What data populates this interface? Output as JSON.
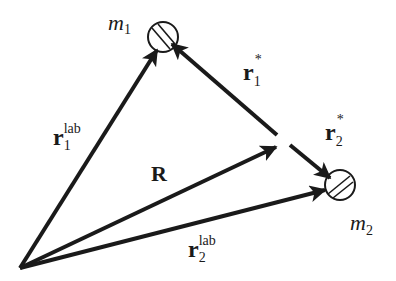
{
  "diagram": {
    "colors": {
      "stroke": "#1a1a1a",
      "background": "#ffffff"
    },
    "masses": [
      {
        "id": "m1",
        "label_base": "m",
        "label_sub": "1",
        "center": [
          163,
          37
        ],
        "radius": 15
      },
      {
        "id": "m2",
        "label_base": "m",
        "label_sub": "2",
        "center": [
          340,
          185
        ],
        "radius": 15
      }
    ],
    "origin": [
      20,
      268
    ],
    "cm_point": [
      282,
      145
    ],
    "vectors": [
      {
        "id": "r1-lab",
        "base": "r",
        "sub": "1",
        "sup": "lab",
        "from": "origin",
        "to": "m1"
      },
      {
        "id": "R",
        "base": "R",
        "sub": "",
        "sup": "",
        "from": "origin",
        "to": "cm"
      },
      {
        "id": "r2-lab",
        "base": "r",
        "sub": "2",
        "sup": "lab",
        "from": "origin",
        "to": "m2"
      },
      {
        "id": "r1-star",
        "base": "r",
        "sub": "1",
        "sup": "*",
        "from": "cm",
        "to": "m1"
      },
      {
        "id": "r2-star",
        "base": "r",
        "sub": "2",
        "sup": "*",
        "from": "cm",
        "to": "m2"
      }
    ]
  }
}
